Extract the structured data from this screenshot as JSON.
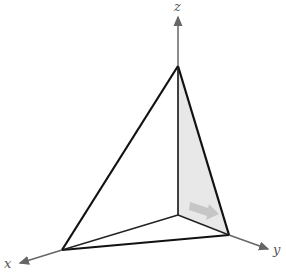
{
  "diagram": {
    "type": "3d-coordinate-tetrahedron",
    "axes": {
      "x": {
        "label": "x"
      },
      "y": {
        "label": "y"
      },
      "z": {
        "label": "z"
      }
    },
    "colors": {
      "axis": "#666666",
      "edge": "#111111",
      "shaded_face": "#e6e6e6",
      "arrow": "#c8c8c8"
    }
  }
}
